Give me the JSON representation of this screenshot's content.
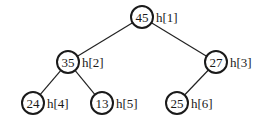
{
  "diagram": {
    "type": "binary-heap-tree",
    "nodes": [
      {
        "id": "n1",
        "value": "45",
        "label": "h[1]",
        "cx": 142,
        "cy": 17
      },
      {
        "id": "n2",
        "value": "35",
        "label": "h[2]",
        "cx": 68,
        "cy": 62
      },
      {
        "id": "n3",
        "value": "27",
        "label": "h[3]",
        "cx": 216,
        "cy": 62
      },
      {
        "id": "n4",
        "value": "24",
        "label": "h[4]",
        "cx": 33,
        "cy": 103
      },
      {
        "id": "n5",
        "value": "13",
        "label": "h[5]",
        "cx": 102,
        "cy": 103
      },
      {
        "id": "n6",
        "value": "25",
        "label": "h[6]",
        "cx": 177,
        "cy": 103
      }
    ],
    "edges": [
      {
        "from": "n1",
        "to": "n2"
      },
      {
        "from": "n1",
        "to": "n3"
      },
      {
        "from": "n2",
        "to": "n4"
      },
      {
        "from": "n2",
        "to": "n5"
      },
      {
        "from": "n3",
        "to": "n6"
      }
    ],
    "node_radius": 11
  }
}
